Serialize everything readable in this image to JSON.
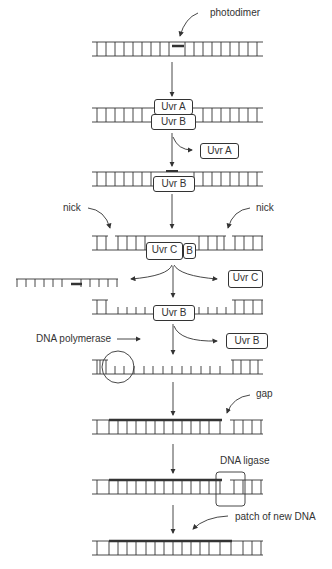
{
  "labels": {
    "photodimer": "photodimer",
    "nick_left": "nick",
    "nick_right": "nick",
    "dna_polymerase": "DNA polymerase",
    "gap": "gap",
    "dna_ligase": "DNA ligase",
    "patch": "patch of new DNA"
  },
  "proteins": {
    "uvra_bound": "Uvr A",
    "uvrb_bound_1": "Uvr B",
    "uvra_released": "Uvr A",
    "uvrb_bound_2": "Uvr B",
    "uvrc_bound": "Uvr C",
    "b_small": "B",
    "uvrc_released": "Uvr C",
    "uvrb_bound_3": "Uvr B",
    "uvrb_released": "Uvr B"
  },
  "steps": [
    "photodimer in DNA",
    "UvrA and UvrB bind",
    "UvrA released",
    "UvrC binds and nicks",
    "oligonucleotide and UvrC released",
    "UvrB released; DNA polymerase fills",
    "gap",
    "DNA ligase seals",
    "patch of new DNA"
  ],
  "colors": {
    "line": "#333333",
    "background": "#ffffff"
  }
}
